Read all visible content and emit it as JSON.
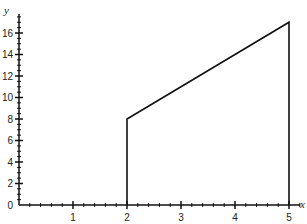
{
  "chart_data": {
    "type": "line",
    "title": "",
    "xlabel": "x",
    "ylabel": "y",
    "xlim": [
      0,
      5.2
    ],
    "ylim": [
      0,
      17.5
    ],
    "xticks": [
      1,
      2,
      3,
      4,
      5
    ],
    "yticks": [
      0,
      2,
      4,
      6,
      8,
      10,
      12,
      14,
      16
    ],
    "grid": false,
    "series": [
      {
        "name": "region boundary",
        "points": [
          [
            2,
            0
          ],
          [
            2,
            8
          ],
          [
            5,
            17
          ],
          [
            5,
            0
          ]
        ]
      }
    ],
    "annotations": []
  },
  "axes": {
    "x_label": "x",
    "y_label": "y",
    "x_tick_labels": [
      "1",
      "2",
      "3",
      "4",
      "5"
    ],
    "y_tick_labels": [
      "0",
      "2",
      "4",
      "6",
      "8",
      "10",
      "12",
      "14",
      "16"
    ]
  }
}
